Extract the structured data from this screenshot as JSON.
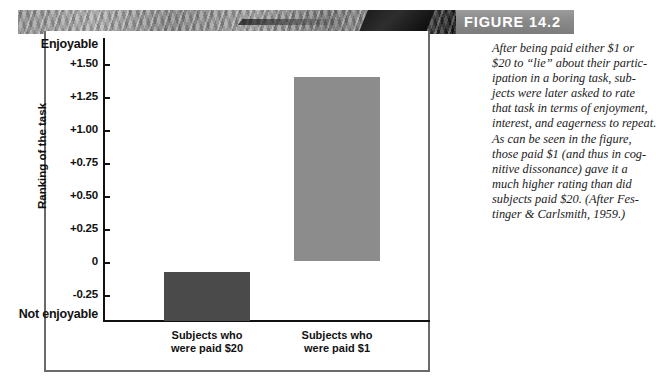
{
  "figure": {
    "label": "FIGURE 14.2",
    "caption_lines": [
      "After being paid either $1 or",
      "$20 to “lie” about their partic-",
      "ipation in a boring task, sub-",
      "jects were later asked to rate",
      "that task in terms of enjoyment,",
      "interest, and eagerness to repeat.",
      "As can be seen in the figure,",
      "those paid $1 (and thus in cog-",
      "nitive dissonance) gave it a",
      "much higher rating than did",
      "subjects paid $20. (After Fes-",
      "tinger & Carlsmith, 1959.)"
    ]
  },
  "chart_data": {
    "type": "bar",
    "title": "",
    "xlabel": "",
    "ylabel": "Ranking of the task",
    "categories": [
      "Subjects who\nwere paid $20",
      "Subjects who\nwere paid $1"
    ],
    "values": [
      -0.05,
      1.4
    ],
    "ylim": [
      -0.45,
      1.7
    ],
    "yticks": [
      1.5,
      1.25,
      1.0,
      0.75,
      0.5,
      0.25,
      0,
      -0.25
    ],
    "ytick_labels": [
      "+1.50",
      "+1.25",
      "+1.00",
      "+0.75",
      "+0.50",
      "+0.25",
      "0",
      "-0.25"
    ],
    "axis_top_label": "Enjoyable",
    "axis_bottom_label": "Not enjoyable",
    "grid": false,
    "legend": null,
    "series": [
      {
        "name": "Ranking of the task",
        "values": [
          -0.05,
          1.4
        ],
        "colors": [
          "#4a4a4a",
          "#8c8c8c"
        ]
      }
    ]
  },
  "colors": {
    "bar_dark": "#4a4a4a",
    "bar_light": "#8c8c8c",
    "axis": "#111111",
    "frame": "#6a6a6a",
    "band_text": "#ffffff"
  }
}
